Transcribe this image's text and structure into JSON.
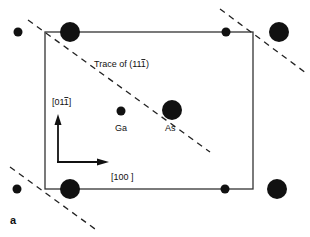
{
  "figure": {
    "panel_label": "a",
    "trace_label_prefix": "Trace of (11",
    "trace_label_bar_digit": "1",
    "trace_label_suffix": ")",
    "direction_vertical_prefix": "[01",
    "direction_vertical_bar_digit": "1",
    "direction_vertical_suffix": "]",
    "direction_horizontal": "[100 ]",
    "atom_labels": {
      "ga": "Ga",
      "as": "As"
    },
    "colors": {
      "ink": "#111111",
      "background": "#ffffff"
    }
  }
}
